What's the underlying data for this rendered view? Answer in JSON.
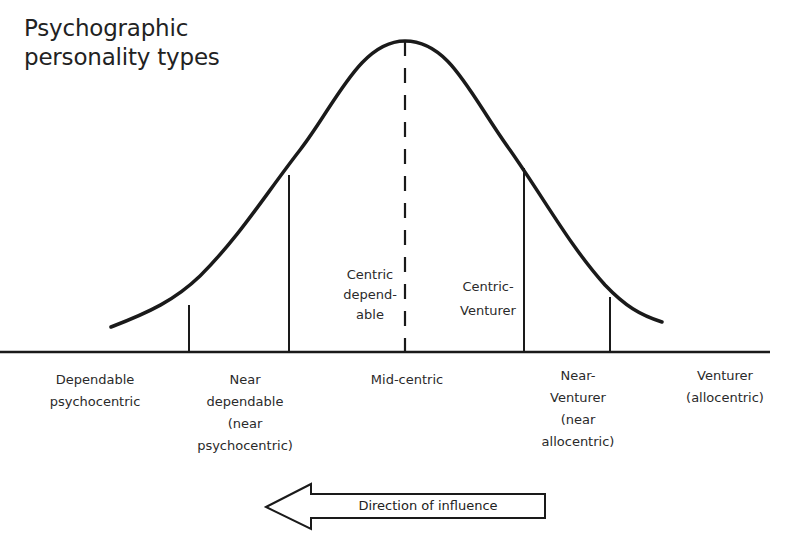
{
  "title": {
    "line1": "Psychographic",
    "line2": "personality types"
  },
  "curve": {
    "type": "bell-curve",
    "stroke_color": "#1a1a1a",
    "center_label": {
      "line1": "Centric",
      "line2": "depend-",
      "line3": "able"
    },
    "right_center_label": {
      "line1": "Centric-",
      "line2": "Venturer"
    }
  },
  "segments": [
    {
      "id": "dependable",
      "line1": "Dependable",
      "line2": "psychocentric"
    },
    {
      "id": "near-dependable",
      "line1": "Near",
      "line2": "dependable",
      "line3": "(near",
      "line4": "psychocentric)"
    },
    {
      "id": "mid-centric",
      "line1": "Mid-centric"
    },
    {
      "id": "near-venturer",
      "line1": "Near-",
      "line2": "Venturer",
      "line3": "(near",
      "line4": "allocentric)"
    },
    {
      "id": "venturer",
      "line1": "Venturer",
      "line2": "(allocentric)"
    }
  ],
  "arrow": {
    "label": "Direction of influence",
    "direction": "left"
  }
}
